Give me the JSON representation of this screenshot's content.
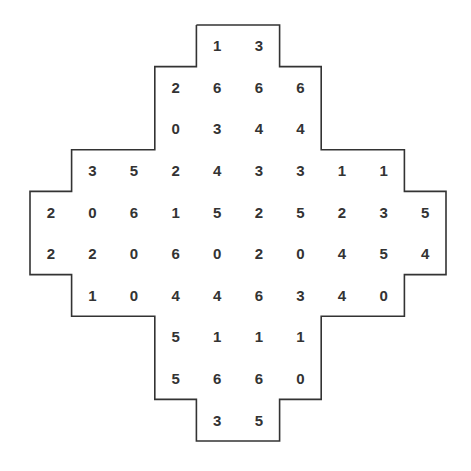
{
  "puzzle": {
    "type": "domino-grid",
    "grid_origin": [
      30,
      25
    ],
    "cell_size": 41.6,
    "rows": [
      {
        "start_col": 4,
        "values": [
          1,
          3
        ]
      },
      {
        "start_col": 3,
        "values": [
          2,
          6,
          6,
          6
        ]
      },
      {
        "start_col": 3,
        "values": [
          0,
          3,
          4,
          4
        ]
      },
      {
        "start_col": 1,
        "values": [
          3,
          5,
          2,
          4,
          3,
          3,
          1,
          1
        ]
      },
      {
        "start_col": 0,
        "values": [
          2,
          0,
          6,
          1,
          5,
          2,
          5,
          2,
          3,
          5
        ]
      },
      {
        "start_col": 0,
        "values": [
          2,
          2,
          0,
          6,
          0,
          2,
          0,
          4,
          5,
          4
        ]
      },
      {
        "start_col": 1,
        "values": [
          1,
          0,
          4,
          4,
          6,
          3,
          4,
          0
        ]
      },
      {
        "start_col": 3,
        "values": [
          5,
          1,
          1,
          1
        ]
      },
      {
        "start_col": 3,
        "values": [
          5,
          6,
          6,
          0
        ]
      },
      {
        "start_col": 4,
        "values": [
          3,
          5
        ]
      }
    ],
    "outline_color": "#333333",
    "text_color": "#333333"
  }
}
